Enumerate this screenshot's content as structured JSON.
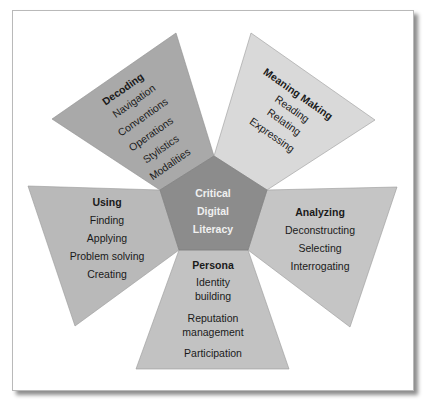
{
  "diagram": {
    "center": {
      "lines": [
        "Critical",
        "Digital",
        "Literacy"
      ],
      "color": "#8c8c8c"
    },
    "sections": [
      {
        "id": "decoding",
        "title": "Decoding",
        "items": [
          "Navigation",
          "Conventions",
          "Operations",
          "Stylistics",
          "Modalities"
        ],
        "color": "#a9a9a9"
      },
      {
        "id": "meaning-making",
        "title": "Meaning Making",
        "items": [
          "Reading",
          "Relating",
          "Expressing"
        ],
        "color": "#d9d9d9"
      },
      {
        "id": "analyzing",
        "title": "Analyzing",
        "items": [
          "Deconstructing",
          "Selecting",
          "Interrogating"
        ],
        "color": "#c5c5c5"
      },
      {
        "id": "persona",
        "title": "Persona",
        "items": [
          "Identity",
          "building",
          "Reputation",
          "management",
          "Participation"
        ],
        "color": "#c2c2c2"
      },
      {
        "id": "using",
        "title": "Using",
        "items": [
          "Finding",
          "Applying",
          "Problem solving",
          "Creating"
        ],
        "color": "#b9b9b9"
      }
    ]
  }
}
